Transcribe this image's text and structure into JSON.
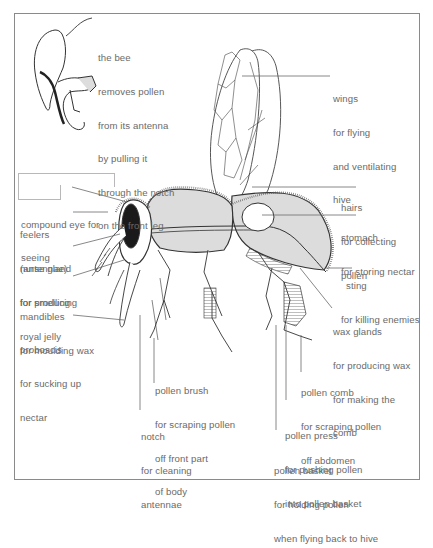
{
  "inset": {
    "caption": [
      "the bee",
      "removes pollen",
      "from its antenna",
      "by pulling it",
      "through the notch",
      "on the front leg"
    ]
  },
  "labels": {
    "wings": {
      "name": "wings",
      "desc": [
        "for flying",
        "and ventilating",
        "hive"
      ]
    },
    "hairs": {
      "name": "hairs",
      "desc": [
        "for collecting",
        "pollen"
      ]
    },
    "stomach": {
      "name": "stomach",
      "desc": [
        "for storing nectar"
      ]
    },
    "sting": {
      "name": "sting",
      "desc": [
        "for killing enemies"
      ]
    },
    "wax_glands": {
      "name": "wax glands",
      "desc": [
        "for producing wax",
        "for making the",
        "comb"
      ]
    },
    "compound_eye": {
      "name": "compound eye for",
      "desc": [
        "seeing"
      ]
    },
    "feelers": {
      "name": "feelers",
      "desc": [
        "(antennae)",
        "for smelling"
      ]
    },
    "nurse_gland": {
      "name": "nurse gland",
      "desc": [
        "for producing",
        "royal jelly"
      ]
    },
    "mandibles": {
      "name": "mandibles",
      "desc": [
        "for moulding wax"
      ]
    },
    "proboscis": {
      "name": "proboscis",
      "desc": [
        "for sucking up",
        "nectar"
      ]
    },
    "pollen_brush": {
      "name": "pollen brush",
      "desc": [
        "for scraping pollen",
        "off front part",
        "of body"
      ]
    },
    "notch": {
      "name": "notch",
      "desc": [
        "for cleaning",
        "antennae"
      ]
    },
    "pollen_comb": {
      "name": "pollen comb",
      "desc": [
        "for scraping pollen",
        "off abdomen"
      ]
    },
    "pollen_press": {
      "name": "pollen press",
      "desc": [
        "for pushing pollen",
        "into pollen basket"
      ]
    },
    "pollen_basket": {
      "name": "pollen basket",
      "desc": [
        "for holding pollen",
        "when flying back to hive"
      ]
    }
  },
  "colors": {
    "frame": "#8a8a8a",
    "text": "#6a6a6a",
    "body_fill": "#dcdcdc",
    "eye": "#1a1a1a",
    "line": "#333333"
  }
}
